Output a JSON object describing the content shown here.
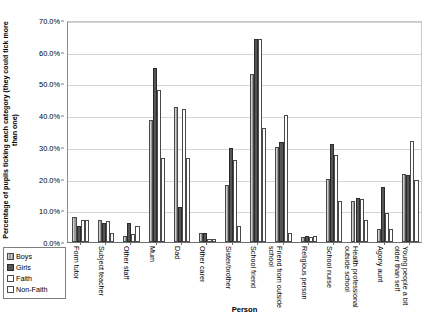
{
  "chart_data": {
    "type": "bar",
    "title": "",
    "xlabel": "Person",
    "ylabel": "Percentage of pupils ticking each category (they could tick more than one)",
    "ylim": [
      0,
      70
    ],
    "ytick_labels": [
      "0.0%",
      "10.0%",
      "20.0%",
      "30.0%",
      "40.0%",
      "50.0%",
      "60.0%",
      "70.0%"
    ],
    "ytick_values": [
      0,
      10,
      20,
      30,
      40,
      50,
      60,
      70
    ],
    "grid": true,
    "legend_position": "bottom-left-outside",
    "categories": [
      "Form tutor",
      "Subject teacher",
      "Other staff",
      "Mum",
      "Dad",
      "Other carer",
      "Sister/brother",
      "School friend",
      "Friend from outside school",
      "Religious person",
      "School nurse",
      "Health professional outside school",
      "Agony aunt",
      "Young people a bit older than self"
    ],
    "series": [
      {
        "name": "Boys",
        "color": "#9a9a9a",
        "values": [
          8.0,
          7.0,
          2.0,
          38.5,
          42.5,
          3.0,
          18.0,
          53.0,
          30.0,
          1.5,
          20.0,
          13.0,
          4.0,
          21.5
        ]
      },
      {
        "name": "Girls",
        "color": "#555555",
        "values": [
          5.0,
          6.0,
          6.0,
          55.0,
          11.0,
          3.0,
          29.5,
          64.0,
          31.5,
          2.0,
          31.0,
          14.0,
          17.5,
          21.0
        ]
      },
      {
        "name": "Faith",
        "color": "#ffffff",
        "values": [
          7.0,
          6.5,
          2.5,
          48.0,
          42.0,
          1.0,
          26.0,
          64.0,
          40.0,
          1.5,
          27.5,
          13.5,
          9.0,
          32.0
        ]
      },
      {
        "name": "Non-Faith",
        "color": "#ffffff",
        "values": [
          7.0,
          3.0,
          5.0,
          26.5,
          26.5,
          1.0,
          5.0,
          36.0,
          3.0,
          2.0,
          13.0,
          7.0,
          4.0,
          19.5
        ]
      }
    ]
  }
}
